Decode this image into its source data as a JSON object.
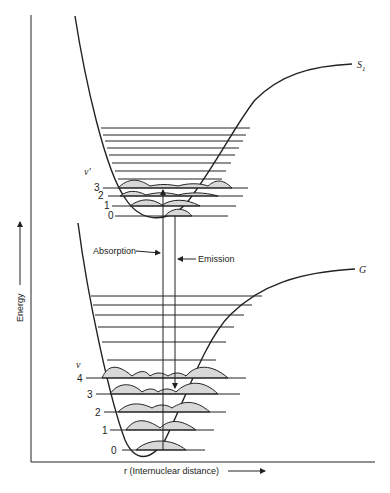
{
  "diagram": {
    "y_axis_label": "Energy",
    "x_axis_label": "r (Internuclear distance)",
    "upper_state_label": "S",
    "upper_state_sub": "1",
    "lower_state_label": "G",
    "upper_vib_symbol": "ν′",
    "lower_vib_symbol": "ν",
    "upper_levels": [
      "0",
      "1",
      "2",
      "3"
    ],
    "lower_levels": [
      "0",
      "1",
      "2",
      "3",
      "4"
    ],
    "absorption_label": "Absorption",
    "emission_label": "Emission",
    "colors": {
      "ink": "#222222",
      "wavefunction_fill": "#d8d8d8",
      "background": "#ffffff"
    }
  }
}
